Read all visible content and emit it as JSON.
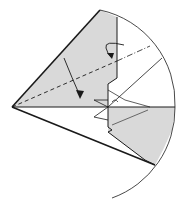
{
  "diagram": {
    "type": "origami-fold-step",
    "colors": {
      "paper_colored": "#d9d9d9",
      "paper_white": "#ffffff",
      "line": "#1a1a1a",
      "background": "#ffffff"
    },
    "symbols": [
      {
        "name": "valley-fold-line",
        "style": "dashed"
      },
      {
        "name": "mountain-fold-line",
        "style": "dash-dot"
      },
      {
        "name": "fold-direction-arrow",
        "style": "curved-arrow"
      },
      {
        "name": "turn-over-arrow",
        "style": "loop-arrow"
      }
    ]
  }
}
